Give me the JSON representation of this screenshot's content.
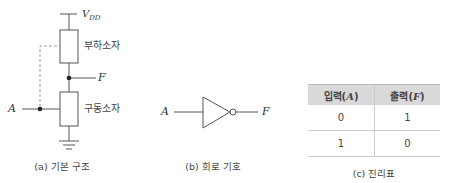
{
  "panel_a": {
    "supply_label_main": "V",
    "supply_label_sub": "DD",
    "load_label": "부하소자",
    "driver_label": "구동소자",
    "input_label": "A",
    "output_label": "F",
    "caption": "(a) 기본 구조"
  },
  "panel_b": {
    "input_label": "A",
    "output_label": "F",
    "caption": "(b) 회로 기호"
  },
  "panel_c": {
    "headers": [
      {
        "text": "입력(",
        "var": "A",
        "close": ")"
      },
      {
        "text": "출력(",
        "var": "F",
        "close": ")"
      }
    ],
    "rows": [
      [
        "0",
        "1"
      ],
      [
        "1",
        "0"
      ]
    ],
    "caption": "(c) 진리표"
  },
  "colors": {
    "line": "#555555",
    "dashed": "#999999",
    "header_bg": "#d9d9d9"
  }
}
